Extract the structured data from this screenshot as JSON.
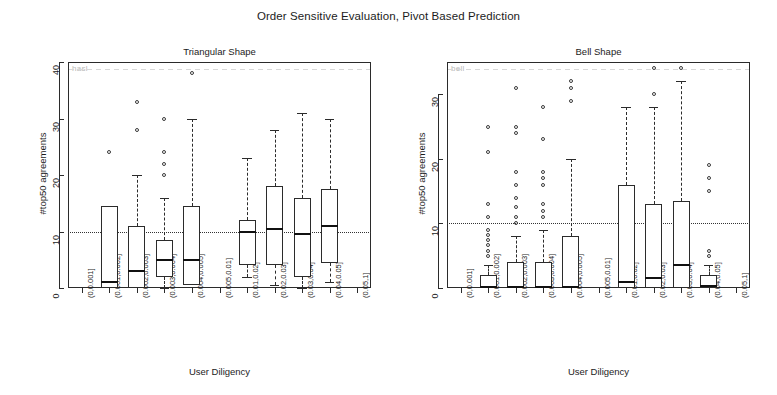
{
  "figure": {
    "title": "Order Sensitive Evaluation, Pivot Based Prediction",
    "artifact_text_left": "hasl",
    "artifact_text_right": "bell"
  },
  "chart_data": [
    {
      "type": "box",
      "title": "Triangular Shape",
      "xlabel": "User Diligency",
      "ylabel": "#top50 agreements",
      "ylim": [
        0,
        40
      ],
      "yticks": [
        0,
        10,
        20,
        30,
        40
      ],
      "grid": false,
      "reference_line": 10,
      "categories": [
        "(0,0.001]",
        "(0.001,0.002]",
        "(0.002,0.003]",
        "(0.003,0.004]",
        "(0.004,0.005]",
        "(0.005,0.01]",
        "(0.01,0.02]",
        "(0.02,0.03]",
        "(0.03,0.04]",
        "(0.04,0.05]",
        "(0.05,1]"
      ],
      "boxes": [
        {
          "category": "(0,0.001]",
          "empty": true,
          "q1": null,
          "median": null,
          "q3": null,
          "lower": null,
          "upper": null,
          "outliers": []
        },
        {
          "category": "(0.001,0.002]",
          "empty": false,
          "q1": 0.0,
          "median": 1.0,
          "q3": 14.5,
          "lower": 0.0,
          "upper": 14.5,
          "outliers": [
            24.0
          ]
        },
        {
          "category": "(0.002,0.003]",
          "empty": false,
          "q1": 0.0,
          "median": 3.0,
          "q3": 11.0,
          "lower": 0.0,
          "upper": 20.0,
          "outliers": [
            28.0,
            33.0
          ]
        },
        {
          "category": "(0.003,0.004]",
          "empty": false,
          "q1": 2.0,
          "median": 5.0,
          "q3": 8.5,
          "lower": 0.0,
          "upper": 16.0,
          "outliers": [
            20.0,
            22.0,
            24.0,
            30.0
          ]
        },
        {
          "category": "(0.004,0.005]",
          "empty": false,
          "q1": 0.5,
          "median": 5.0,
          "q3": 14.5,
          "lower": 0.5,
          "upper": 30.0,
          "outliers": [
            38.0
          ]
        },
        {
          "category": "(0.005,0.01]",
          "empty": true,
          "q1": null,
          "median": null,
          "q3": null,
          "lower": null,
          "upper": null,
          "outliers": []
        },
        {
          "category": "(0.01,0.02]",
          "empty": false,
          "q1": 4.0,
          "median": 10.0,
          "q3": 12.0,
          "lower": 2.0,
          "upper": 23.0,
          "outliers": []
        },
        {
          "category": "(0.02,0.03]",
          "empty": false,
          "q1": 4.0,
          "median": 10.5,
          "q3": 18.0,
          "lower": 0.5,
          "upper": 28.0,
          "outliers": []
        },
        {
          "category": "(0.03,0.04]",
          "empty": false,
          "q1": 2.0,
          "median": 9.5,
          "q3": 16.0,
          "lower": 0.0,
          "upper": 31.0,
          "outliers": []
        },
        {
          "category": "(0.04,0.05]",
          "empty": false,
          "q1": 4.5,
          "median": 11.0,
          "q3": 17.5,
          "lower": 1.0,
          "upper": 30.0,
          "outliers": []
        },
        {
          "category": "(0.05,1]",
          "empty": true,
          "q1": null,
          "median": null,
          "q3": null,
          "lower": null,
          "upper": null,
          "outliers": []
        }
      ]
    },
    {
      "type": "box",
      "title": "Bell Shape",
      "xlabel": "User Diligency",
      "ylabel": "#top50 agreements",
      "ylim": [
        0,
        35
      ],
      "yticks": [
        0,
        10,
        20,
        30
      ],
      "grid": false,
      "reference_line": 10,
      "categories": [
        "(0,0.001]",
        "(0.001,0.002]",
        "(0.002,0.003]",
        "(0.003,0.004]",
        "(0.004,0.005]",
        "(0.005,0.01]",
        "(0.01,0.02]",
        "(0.02,0.03]",
        "(0.03,0.04]",
        "(0.04,0.05]",
        "(0.05,1]"
      ],
      "boxes": [
        {
          "category": "(0,0.001]",
          "empty": true,
          "q1": null,
          "median": null,
          "q3": null,
          "lower": null,
          "upper": null,
          "outliers": []
        },
        {
          "category": "(0.001,0.002]",
          "empty": false,
          "q1": 0.0,
          "median": 0.2,
          "q3": 2.0,
          "lower": 0.0,
          "upper": 3.5,
          "outliers": [
            5.0,
            5.8,
            6.6,
            7.4,
            8.2,
            9.0,
            11.0,
            13.0,
            21.0,
            25.0
          ]
        },
        {
          "category": "(0.002,0.003]",
          "empty": false,
          "q1": 0.0,
          "median": 0.2,
          "q3": 4.0,
          "lower": 0.0,
          "upper": 8.0,
          "outliers": [
            10.0,
            11.0,
            12.5,
            14.0,
            16.0,
            18.0,
            24.0,
            25.0,
            31.0
          ]
        },
        {
          "category": "(0.003,0.004]",
          "empty": false,
          "q1": 0.0,
          "median": 0.2,
          "q3": 4.0,
          "lower": 0.0,
          "upper": 9.0,
          "outliers": [
            11.0,
            12.0,
            13.0,
            16.0,
            17.0,
            18.0,
            23.0,
            28.0
          ]
        },
        {
          "category": "(0.004,0.005]",
          "empty": false,
          "q1": 0.0,
          "median": 0.2,
          "q3": 8.0,
          "lower": 0.0,
          "upper": 20.0,
          "outliers": [
            29.0,
            31.0,
            32.0
          ]
        },
        {
          "category": "(0.005,0.01]",
          "empty": true,
          "q1": null,
          "median": null,
          "q3": null,
          "lower": null,
          "upper": null,
          "outliers": []
        },
        {
          "category": "(0.01,0.02]",
          "empty": false,
          "q1": 0.0,
          "median": 1.0,
          "q3": 16.0,
          "lower": 0.0,
          "upper": 28.0,
          "outliers": []
        },
        {
          "category": "(0.02,0.03]",
          "empty": false,
          "q1": 0.0,
          "median": 1.5,
          "q3": 13.0,
          "lower": 0.0,
          "upper": 28.0,
          "outliers": [
            30.0,
            34.0
          ]
        },
        {
          "category": "(0.03,0.04]",
          "empty": false,
          "q1": 0.0,
          "median": 3.5,
          "q3": 13.5,
          "lower": 0.0,
          "upper": 32.0,
          "outliers": [
            34.0
          ]
        },
        {
          "category": "(0.04,0.05]",
          "empty": false,
          "q1": 0.0,
          "median": 0.3,
          "q3": 2.0,
          "lower": 0.0,
          "upper": 3.5,
          "outliers": [
            5.0,
            5.8,
            15.0,
            17.0,
            19.0
          ]
        },
        {
          "category": "(0.05,1]",
          "empty": true,
          "q1": null,
          "median": null,
          "q3": null,
          "lower": null,
          "upper": null,
          "outliers": []
        }
      ]
    }
  ]
}
